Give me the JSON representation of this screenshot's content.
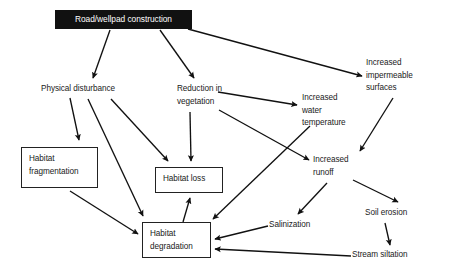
{
  "diagram": {
    "canvas": {
      "width": 450,
      "height": 271,
      "background": "#ffffff"
    },
    "style": {
      "edge_color": "#111111",
      "node_border_color": "#222222",
      "root_fill": "#111111",
      "root_text_color": "#ffffff",
      "text_color": "#1a1a1a"
    },
    "nodes": [
      {
        "id": "road",
        "label": "Road/wellpad construction",
        "shape": "filled-box",
        "x": 55,
        "y": 10,
        "w": 137,
        "h": 19
      },
      {
        "id": "physical_disturbance",
        "label": "Physical disturbance",
        "shape": "plain",
        "x": 41,
        "y": 83,
        "w": 106,
        "h": 14
      },
      {
        "id": "reduction_vegetation",
        "label": "Reduction in\nvegetation",
        "shape": "plain",
        "x": 177,
        "y": 83,
        "w": 70,
        "h": 27
      },
      {
        "id": "impermeable_surfaces",
        "label": "Increased\nimpermeable\nsurfaces",
        "shape": "plain",
        "x": 366,
        "y": 57,
        "w": 72,
        "h": 40
      },
      {
        "id": "water_temperature",
        "label": "Increased\nwater\ntemperature",
        "shape": "plain",
        "x": 302,
        "y": 92,
        "w": 66,
        "h": 40
      },
      {
        "id": "habitat_fragmentation",
        "label": "Habitat\nfragmentation",
        "shape": "box",
        "x": 21,
        "y": 147,
        "w": 77,
        "h": 41
      },
      {
        "id": "habitat_loss",
        "label": "Habitat loss",
        "shape": "box",
        "x": 155,
        "y": 167,
        "w": 68,
        "h": 26
      },
      {
        "id": "increased_runoff",
        "label": "Increased\nrunoff",
        "shape": "plain",
        "x": 313,
        "y": 154,
        "w": 62,
        "h": 27
      },
      {
        "id": "soil_erosion",
        "label": "Soil erosion",
        "shape": "plain",
        "x": 365,
        "y": 207,
        "w": 58,
        "h": 14
      },
      {
        "id": "salinization",
        "label": "Salinization",
        "shape": "plain",
        "x": 269,
        "y": 219,
        "w": 57,
        "h": 14
      },
      {
        "id": "habitat_degradation",
        "label": "Habitat\ndegradation",
        "shape": "box",
        "x": 142,
        "y": 222,
        "w": 69,
        "h": 36
      },
      {
        "id": "stream_siltation",
        "label": "Stream siltation",
        "shape": "plain",
        "x": 352,
        "y": 249,
        "w": 72,
        "h": 14
      }
    ],
    "edges": [
      {
        "from": "road",
        "to": "physical_disturbance",
        "x1": 110,
        "y1": 30,
        "x2": 93,
        "y2": 78
      },
      {
        "from": "road",
        "to": "reduction_vegetation",
        "x1": 160,
        "y1": 30,
        "x2": 194,
        "y2": 78
      },
      {
        "from": "road",
        "to": "impermeable_surfaces",
        "x1": 188,
        "y1": 29,
        "x2": 362,
        "y2": 76
      },
      {
        "from": "physical_disturbance",
        "to": "habitat_fragmentation",
        "x1": 70,
        "y1": 98,
        "x2": 79,
        "y2": 140
      },
      {
        "from": "physical_disturbance",
        "to": "habitat_degradation",
        "x1": 88,
        "y1": 99,
        "x2": 143,
        "y2": 216
      },
      {
        "from": "physical_disturbance",
        "to": "habitat_loss",
        "x1": 111,
        "y1": 99,
        "x2": 168,
        "y2": 161
      },
      {
        "from": "habitat_fragmentation",
        "to": "habitat_degradation",
        "x1": 70,
        "y1": 191,
        "x2": 138,
        "y2": 234
      },
      {
        "from": "reduction_vegetation",
        "to": "habitat_loss",
        "x1": 190,
        "y1": 112,
        "x2": 191,
        "y2": 161
      },
      {
        "from": "reduction_vegetation",
        "to": "water_temperature",
        "x1": 218,
        "y1": 92,
        "x2": 297,
        "y2": 105
      },
      {
        "from": "reduction_vegetation",
        "to": "increased_runoff",
        "x1": 219,
        "y1": 110,
        "x2": 309,
        "y2": 160
      },
      {
        "from": "water_temperature",
        "to": "habitat_degradation",
        "x1": 310,
        "y1": 126,
        "x2": 213,
        "y2": 219
      },
      {
        "from": "impermeable_surfaces",
        "to": "increased_runoff",
        "x1": 393,
        "y1": 98,
        "x2": 360,
        "y2": 151
      },
      {
        "from": "increased_runoff",
        "to": "salinization",
        "x1": 327,
        "y1": 183,
        "x2": 298,
        "y2": 214
      },
      {
        "from": "increased_runoff",
        "to": "soil_erosion",
        "x1": 353,
        "y1": 180,
        "x2": 398,
        "y2": 202
      },
      {
        "from": "soil_erosion",
        "to": "stream_siltation",
        "x1": 385,
        "y1": 223,
        "x2": 390,
        "y2": 245
      },
      {
        "from": "salinization",
        "to": "habitat_degradation",
        "x1": 268,
        "y1": 226,
        "x2": 215,
        "y2": 239
      },
      {
        "from": "stream_siltation",
        "to": "habitat_degradation",
        "x1": 351,
        "y1": 256,
        "x2": 215,
        "y2": 249
      },
      {
        "from": "habitat_degradation",
        "to": "habitat_loss",
        "x1": 183,
        "y1": 222,
        "x2": 190,
        "y2": 198
      }
    ]
  }
}
